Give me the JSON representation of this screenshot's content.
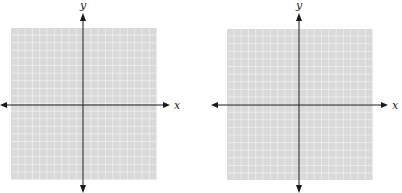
{
  "figure": {
    "colors": {
      "grid_fill": "#d9d9d9",
      "grid_lines": "#ffffff",
      "axis": "#1a1a1a",
      "background": "#ffffff"
    },
    "panels": [
      {
        "id": "left",
        "x_label": "x",
        "y_label": "y",
        "grid_cells": 20
      },
      {
        "id": "right",
        "x_label": "x",
        "y_label": "y",
        "grid_cells": 20
      }
    ]
  }
}
